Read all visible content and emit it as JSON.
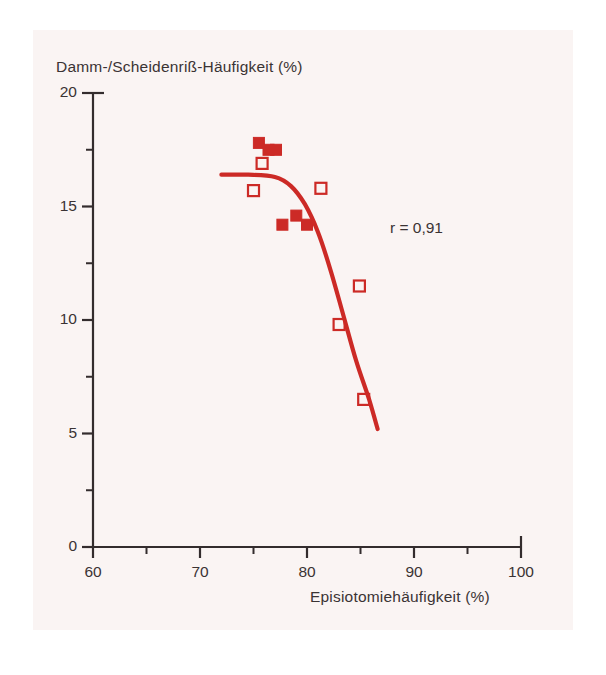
{
  "figure": {
    "background_color": "#faf4f3",
    "series_color": "#cc2a26",
    "axis_color": "#332c2d",
    "text_color": "#3a3334"
  },
  "annotation": {
    "correlation_label": "r = 0,91"
  },
  "chart_data": {
    "type": "scatter",
    "title": "",
    "xlabel": "Episiotomiehäufigkeit (%)",
    "ylabel": "Damm-/Scheidenriß-Häufigkeit (%)",
    "xlim": [
      60,
      100
    ],
    "ylim": [
      0,
      20
    ],
    "xticks": [
      60,
      70,
      80,
      90,
      100
    ],
    "xtick_labels": [
      "60",
      "70",
      "80",
      "90",
      "100"
    ],
    "yticks": [
      0,
      5,
      10,
      15,
      20
    ],
    "ytick_labels": [
      "0",
      "5",
      "10",
      "15",
      "20"
    ],
    "x_minor_ticks": [
      65,
      75,
      85,
      95
    ],
    "y_minor_ticks": [
      2.5,
      7.5,
      12.5,
      17.5
    ],
    "grid": false,
    "legend": "none",
    "annotations": [
      {
        "text": "r = 0,91",
        "x": 88.5,
        "y": 13.8
      }
    ],
    "series": [
      {
        "name": "filled-squares",
        "marker": "filled-square",
        "color": "#cc2a26",
        "points": [
          {
            "x": 75.5,
            "y": 17.8
          },
          {
            "x": 76.4,
            "y": 17.5
          },
          {
            "x": 77.1,
            "y": 17.5
          },
          {
            "x": 77.7,
            "y": 14.2
          },
          {
            "x": 79.0,
            "y": 14.6
          },
          {
            "x": 80.0,
            "y": 14.2
          }
        ]
      },
      {
        "name": "open-squares",
        "marker": "open-square",
        "color": "#cc2a26",
        "points": [
          {
            "x": 75.8,
            "y": 16.9
          },
          {
            "x": 75.0,
            "y": 15.7
          },
          {
            "x": 81.3,
            "y": 15.8
          },
          {
            "x": 84.9,
            "y": 11.5
          },
          {
            "x": 83.0,
            "y": 9.8
          },
          {
            "x": 85.3,
            "y": 6.5
          }
        ]
      },
      {
        "name": "fitted-curve",
        "marker": "line",
        "color": "#cc2a26",
        "points": [
          {
            "x": 72.0,
            "y": 16.4
          },
          {
            "x": 74.5,
            "y": 16.4
          },
          {
            "x": 77.0,
            "y": 16.3
          },
          {
            "x": 78.5,
            "y": 15.9
          },
          {
            "x": 79.8,
            "y": 15.1
          },
          {
            "x": 81.0,
            "y": 13.9
          },
          {
            "x": 82.2,
            "y": 12.2
          },
          {
            "x": 83.4,
            "y": 10.2
          },
          {
            "x": 84.6,
            "y": 8.2
          },
          {
            "x": 85.8,
            "y": 6.5
          },
          {
            "x": 86.6,
            "y": 5.2
          }
        ]
      }
    ]
  }
}
